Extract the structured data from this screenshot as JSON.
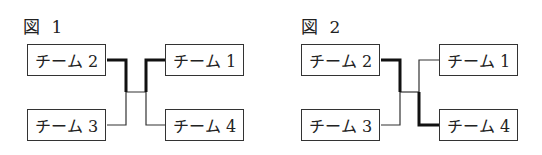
{
  "figures": [
    {
      "title": "図 1",
      "left": {
        "top": "チーム 2",
        "bottom": "チーム 3"
      },
      "right": {
        "top": "チーム 1",
        "bottom": "チーム 4"
      },
      "bold_path": [
        "チーム 2",
        "チーム 1"
      ]
    },
    {
      "title": "図 2",
      "left": {
        "top": "チーム 2",
        "bottom": "チーム 3"
      },
      "right": {
        "top": "チーム 1",
        "bottom": "チーム 4"
      },
      "bold_path": [
        "チーム 2",
        "チーム 4"
      ]
    }
  ]
}
